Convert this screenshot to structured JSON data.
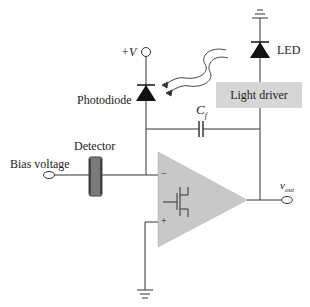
{
  "diagram": {
    "labels": {
      "supply": "+V",
      "photodiode": "Photodiode",
      "led": "LED",
      "light_driver": "Light driver",
      "feedback_cap_main": "C",
      "feedback_cap_sub": "f",
      "detector": "Detector",
      "bias_voltage": "Bias voltage",
      "output_main": "v",
      "output_sub": "out",
      "minus": "−",
      "plus": "+"
    },
    "colors": {
      "wire": "#333333",
      "fill_gray": "#c8c8c8",
      "driver_box": "#d6d6d6",
      "detector": "#7a7a7a",
      "diode": "#111111"
    },
    "components": [
      "supply terminal +V",
      "photodiode",
      "LED",
      "light driver",
      "feedback capacitor Cf",
      "detector",
      "bias voltage terminal",
      "op-amp with FET input",
      "output terminal vout",
      "ground x2"
    ]
  }
}
